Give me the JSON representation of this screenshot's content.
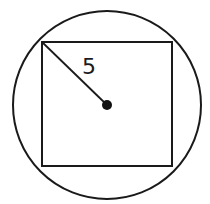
{
  "diagram": {
    "radius_label": "5",
    "colors": {
      "stroke": "#1a1a1a",
      "background": "#ffffff"
    },
    "shapes": {
      "circle": {
        "cx": 107,
        "cy": 105,
        "r": 94
      },
      "square": {
        "x": 42,
        "y": 42,
        "width": 130,
        "height": 124
      },
      "radius_line": {
        "x1": 42,
        "y1": 42,
        "x2": 107,
        "y2": 105
      },
      "center_dot": {
        "cx": 107,
        "cy": 105,
        "r": 5
      }
    }
  }
}
